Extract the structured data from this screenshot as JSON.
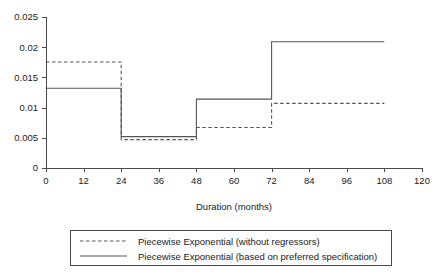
{
  "chart_data": {
    "type": "line",
    "subtype": "step",
    "title": "",
    "xlabel": "Duration (months)",
    "ylabel": "",
    "xlim": [
      0,
      120
    ],
    "ylim": [
      0,
      0.025
    ],
    "xticks": [
      0,
      12,
      24,
      36,
      48,
      60,
      72,
      84,
      96,
      108,
      120
    ],
    "xticklabels": [
      "0",
      "12",
      "24",
      "36",
      "48",
      "60",
      "72",
      "84",
      "96",
      "108",
      "120"
    ],
    "yticks": [
      0,
      0.005,
      0.01,
      0.015,
      0.02,
      0.025
    ],
    "yticklabels": [
      "0",
      "0.005",
      "0.01",
      "0.015",
      "0.02",
      "0.025"
    ],
    "grid": false,
    "legend_position": "below",
    "breakpoints": [
      0,
      24,
      48,
      72,
      108
    ],
    "series": [
      {
        "name": "Piecewise Exponential (without regressors)",
        "style": "dashed",
        "color": "#555555",
        "intervals": [
          {
            "start": 0,
            "end": 24,
            "value": 0.01755
          },
          {
            "start": 24,
            "end": 48,
            "value": 0.0047
          },
          {
            "start": 48,
            "end": 72,
            "value": 0.0067
          },
          {
            "start": 72,
            "end": 108,
            "value": 0.0107
          }
        ],
        "values": [
          0.01755,
          0.0047,
          0.0067,
          0.0107
        ]
      },
      {
        "name": "Piecewise Exponential (based on preferred specification)",
        "style": "solid",
        "color": "#555555",
        "intervals": [
          {
            "start": 0,
            "end": 24,
            "value": 0.0132
          },
          {
            "start": 24,
            "end": 48,
            "value": 0.0052
          },
          {
            "start": 48,
            "end": 72,
            "value": 0.0114
          },
          {
            "start": 72,
            "end": 108,
            "value": 0.0209
          }
        ],
        "values": [
          0.0132,
          0.0052,
          0.0114,
          0.0209
        ]
      }
    ]
  },
  "legend": {
    "entries": [
      {
        "label": "Piecewise Exponential (without regressors)",
        "style": "dashed"
      },
      {
        "label": "Piecewise Exponential (based on preferred specification)",
        "style": "solid"
      }
    ]
  },
  "axes": {
    "x_title": "Duration (months)"
  }
}
